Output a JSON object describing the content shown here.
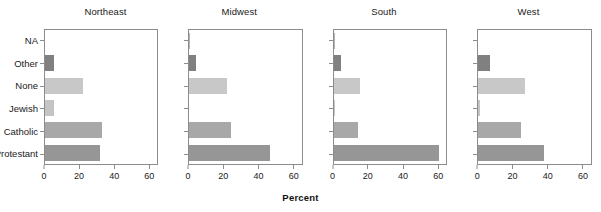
{
  "chart_data": {
    "type": "bar",
    "orientation": "horizontal",
    "title": "",
    "xlabel": "Percent",
    "ylabel": "",
    "xlim": [
      0,
      65
    ],
    "ylim": [
      0,
      6
    ],
    "xticks": [
      0,
      20,
      40,
      60
    ],
    "xtick_labels": [
      "0",
      "20",
      "40",
      "60"
    ],
    "grid": false,
    "legend": "none",
    "facet_layout": "1x4",
    "categories": [
      "NA",
      "Other",
      "None",
      "Jewish",
      "Catholic",
      "Protestant"
    ],
    "panels": [
      {
        "title": "Northeast",
        "values": [
          0,
          5,
          22,
          5,
          33,
          32
        ]
      },
      {
        "title": "Midwest",
        "values": [
          0.5,
          4,
          22,
          0,
          24,
          47
        ]
      },
      {
        "title": "South",
        "values": [
          0.5,
          4,
          15,
          0.5,
          14,
          61
        ]
      },
      {
        "title": "West",
        "values": [
          0,
          7,
          27,
          1,
          25,
          38
        ]
      }
    ],
    "bar_colors": {
      "NA": "#b4b4b4",
      "Other": "#808080",
      "None": "#c8c8c8",
      "Jewish": "#c4c4c4",
      "Catholic": "#a8a8a8",
      "Protestant": "#969696"
    },
    "axis_color": "#8c8c8c",
    "text_color": "#1a1a1a",
    "background": "#ffffff"
  }
}
